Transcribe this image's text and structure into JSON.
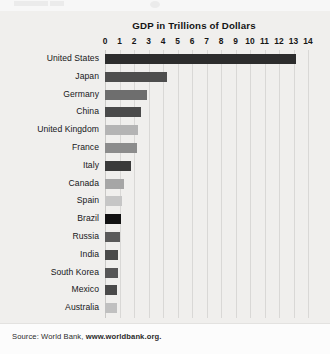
{
  "chart_data": {
    "type": "bar",
    "orientation": "horizontal",
    "title": "GDP in Trillions of Dollars",
    "xlabel": "",
    "ylabel": "",
    "xlim": [
      0,
      14
    ],
    "xticks": [
      0,
      1,
      2,
      3,
      4,
      5,
      6,
      7,
      8,
      9,
      10,
      11,
      12,
      13,
      14
    ],
    "xtick_labels": [
      "0",
      "1",
      "2",
      "3",
      "4",
      "5",
      "6",
      "7",
      "8",
      "9",
      "10",
      "11",
      "12",
      "13",
      "14"
    ],
    "grid": true,
    "legend": "none",
    "categories": [
      "United States",
      "Japan",
      "Germany",
      "China",
      "United Kingdom",
      "France",
      "Italy",
      "Canada",
      "Spain",
      "Brazil",
      "Russia",
      "India",
      "South Korea",
      "Mexico",
      "Australia"
    ],
    "values": [
      13.2,
      4.3,
      2.9,
      2.5,
      2.3,
      2.2,
      1.8,
      1.3,
      1.2,
      1.1,
      1.0,
      0.9,
      0.9,
      0.8,
      0.8
    ],
    "bar_colors": [
      "#2d2d2d",
      "#4e4e4e",
      "#6e6e6e",
      "#4a4a4a",
      "#b4b4b4",
      "#8c8c8c",
      "#3a3a3a",
      "#a6a6a6",
      "#c6c6c6",
      "#121212",
      "#5a5a5a",
      "#4a4a4a",
      "#565656",
      "#4a4a4a",
      "#c0c0c0"
    ],
    "source_prefix": "Source: World Bank, ",
    "source_link": "www.worldbank.org."
  },
  "colors": {
    "panel_background": "#f0efed",
    "footer_background": "#fcfcfc",
    "gridline": "#d9d8d6",
    "text": "#17171a",
    "title": "#141414"
  }
}
